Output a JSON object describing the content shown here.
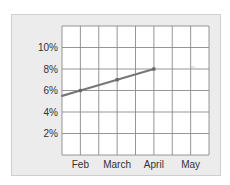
{
  "chart_data": {
    "type": "line",
    "title": "",
    "xlabel": "",
    "ylabel": "",
    "categories": [
      "Feb",
      "March",
      "April",
      "May"
    ],
    "series": [
      {
        "name": "series-1",
        "values": [
          6,
          7,
          8,
          null
        ],
        "unit": "%",
        "color": "#777777"
      }
    ],
    "line_start_left_edge_value": 5.5,
    "yticks": [
      "2%",
      "4%",
      "6%",
      "8%",
      "10%"
    ],
    "ytick_values": [
      2,
      4,
      6,
      8,
      10
    ],
    "ylim": [
      0,
      12
    ],
    "grid": true,
    "legend": "none",
    "annotations": [
      {
        "text": "-",
        "category": "May",
        "value": 8,
        "note": "faint dash mark"
      }
    ]
  },
  "colors": {
    "frame_bg": "#ececec",
    "plot_bg": "#ffffff",
    "grid": "#8a8a8a",
    "line": "#777777",
    "text": "#333333"
  }
}
